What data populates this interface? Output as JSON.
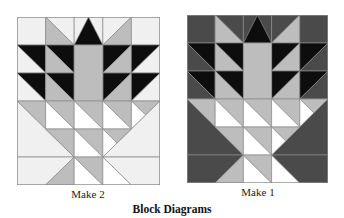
{
  "colors": {
    "light": "#f0f0f0",
    "white": "#ffffff",
    "gray": "#bdbdbd",
    "black": "#0d0d0d",
    "dark": "#4a4a4a",
    "line": "#8a8a8a"
  },
  "blocks": [
    {
      "id": "left",
      "label": "Make 2",
      "variant": "light-background"
    },
    {
      "id": "right",
      "label": "Make 1",
      "variant": "dark-background"
    }
  ],
  "caption": "Block Diagrams"
}
